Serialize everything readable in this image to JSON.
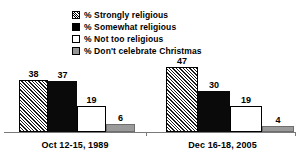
{
  "chart_data": {
    "type": "bar",
    "title": "",
    "xlabel": "",
    "ylabel": "",
    "ylim": [
      0,
      50
    ],
    "grid": false,
    "legend_position": "top-center",
    "categories": [
      "Oct 12-15, 1989",
      "Dec 16-18, 2005"
    ],
    "series": [
      {
        "name": "% Strongly religious",
        "swatch": "hatch",
        "values": [
          38,
          37
        ]
      },
      {
        "name": "% Somewhat religious",
        "swatch": "solid",
        "values": [
          37,
          30
        ]
      },
      {
        "name": "% Not too religious",
        "swatch": "white",
        "values": [
          19,
          19
        ]
      },
      {
        "name": "% Don't celebrate Christmas",
        "swatch": "gray",
        "values": [
          6,
          4
        ]
      }
    ],
    "groups": [
      {
        "category": "Oct 12-15, 1989",
        "bars": [
          {
            "series": "% Strongly religious",
            "value": 38,
            "label": "38",
            "swatch": "hatch"
          },
          {
            "series": "% Somewhat religious",
            "value": 37,
            "label": "37",
            "swatch": "solid"
          },
          {
            "series": "% Not too religious",
            "value": 19,
            "label": "19",
            "swatch": "white"
          },
          {
            "series": "% Don't celebrate Christmas",
            "value": 6,
            "label": "6",
            "swatch": "gray"
          }
        ]
      },
      {
        "category": "Dec 16-18, 2005",
        "bars": [
          {
            "series": "% Strongly religious",
            "value": 47,
            "label": "47",
            "swatch": "hatch"
          },
          {
            "series": "% Somewhat religious",
            "value": 30,
            "label": "30",
            "swatch": "solid"
          },
          {
            "series": "% Not too religious",
            "value": 19,
            "label": "19",
            "swatch": "white"
          },
          {
            "series": "% Don't celebrate Christmas",
            "value": 4,
            "label": "4",
            "swatch": "gray"
          }
        ]
      }
    ]
  },
  "legend": {
    "items": [
      {
        "label": "% Strongly religious",
        "swatch": "hatch"
      },
      {
        "label": "% Somewhat religious",
        "swatch": "solid"
      },
      {
        "label": "% Not too religious",
        "swatch": "white"
      },
      {
        "label": "% Don't celebrate Christmas",
        "swatch": "gray"
      }
    ]
  },
  "colors": {
    "solid": "#0a0a0a",
    "gray": "#9a9a9a",
    "white": "#ffffff",
    "axis": "#7a7a7a",
    "text": "#000000",
    "background": "#ffffff"
  },
  "axis": {
    "categories": [
      "Oct 12-15, 1989",
      "Dec 16-18, 2005"
    ]
  },
  "cutoff_title": ""
}
